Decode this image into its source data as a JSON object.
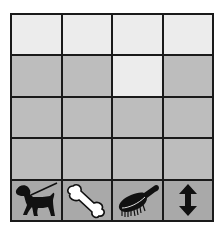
{
  "board": {
    "columns": 4,
    "rows": 4,
    "colors": {
      "light": "#ececec",
      "mid": "#bdbdbd",
      "icon_row": "#a9a9a9",
      "grid_line": "#1a1a1a"
    },
    "cells": [
      [
        "light",
        "light",
        "light",
        "light"
      ],
      [
        "mid",
        "mid",
        "light",
        "mid"
      ],
      [
        "mid",
        "mid",
        "mid",
        "mid"
      ],
      [
        "mid",
        "mid",
        "mid",
        "mid"
      ]
    ]
  },
  "toolbar": {
    "items": [
      {
        "icon": "dog-on-leash-icon",
        "label": "Dog"
      },
      {
        "icon": "bone-icon",
        "label": "Bone"
      },
      {
        "icon": "hairbrush-icon",
        "label": "Brush"
      },
      {
        "icon": "vertical-arrows-icon",
        "label": "Move"
      }
    ]
  }
}
